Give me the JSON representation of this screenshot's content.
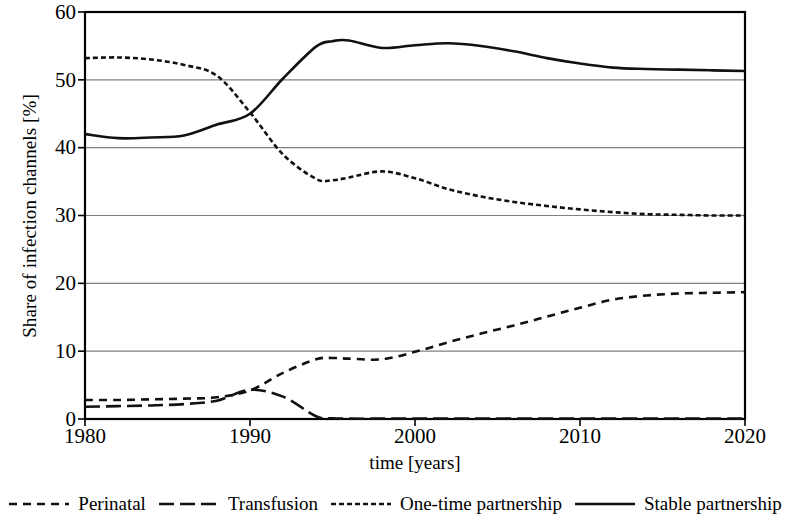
{
  "chart_data": {
    "type": "line",
    "title": "",
    "xlabel": "time [years]",
    "ylabel": "Share of infection channels [%]",
    "xlim": [
      1980,
      2020
    ],
    "ylim": [
      0,
      60
    ],
    "xticks": [
      1980,
      1990,
      2000,
      2010,
      2020
    ],
    "yticks": [
      0,
      10,
      20,
      30,
      40,
      50,
      60
    ],
    "grid": "horizontal",
    "legend_position": "bottom",
    "x": [
      1980,
      1982,
      1984,
      1986,
      1988,
      1990,
      1992,
      1994,
      1995,
      1996,
      1998,
      2000,
      2002,
      2004,
      2006,
      2008,
      2010,
      2012,
      2014,
      2016,
      2018,
      2020
    ],
    "series": [
      {
        "name": "Perinatal",
        "dash": "medium-dash",
        "values": [
          2.8,
          2.8,
          2.9,
          3.0,
          3.2,
          4.2,
          6.8,
          8.8,
          9.0,
          8.9,
          8.8,
          9.9,
          11.3,
          12.6,
          13.8,
          15.1,
          16.4,
          17.6,
          18.2,
          18.5,
          18.6,
          18.7
        ]
      },
      {
        "name": "Transfusion",
        "dash": "long-dash",
        "values": [
          1.8,
          1.9,
          2.0,
          2.2,
          2.7,
          4.3,
          3.3,
          0.4,
          0.1,
          0.05,
          0.05,
          0.05,
          0.05,
          0.05,
          0.05,
          0.05,
          0.05,
          0.05,
          0.05,
          0.05,
          0.05,
          0.05
        ]
      },
      {
        "name": "One-time partnership",
        "dash": "short-dash",
        "values": [
          53.2,
          53.3,
          53.0,
          52.2,
          50.6,
          45.2,
          39.0,
          35.4,
          35.2,
          35.6,
          36.5,
          35.5,
          33.9,
          32.8,
          32.0,
          31.4,
          30.9,
          30.5,
          30.2,
          30.1,
          30.0,
          30.0
        ]
      },
      {
        "name": "Stable partnership",
        "dash": "solid",
        "values": [
          42.0,
          41.4,
          41.5,
          41.8,
          43.4,
          45.0,
          50.2,
          54.9,
          55.7,
          55.8,
          54.7,
          55.1,
          55.4,
          55.0,
          54.2,
          53.2,
          52.4,
          51.8,
          51.6,
          51.5,
          51.4,
          51.3
        ]
      }
    ]
  },
  "axis": {
    "y_tick_labels": [
      "60",
      "50",
      "40",
      "30",
      "20",
      "10",
      "0"
    ],
    "x_tick_labels": [
      "1980",
      "1990",
      "2000",
      "2010",
      "2020"
    ],
    "y_title": "Share of infection channels [%]",
    "x_title": "time [years]"
  },
  "legend": {
    "items": [
      {
        "label": "Perinatal",
        "style": "medium-dash"
      },
      {
        "label": "Transfusion",
        "style": "long-dash"
      },
      {
        "label": "One-time partnership",
        "style": "short-dash"
      },
      {
        "label": "Stable partnership",
        "style": "solid"
      }
    ]
  },
  "colors": {
    "line": "#111111",
    "grid": "#808080",
    "axis": "#000000",
    "background": "#ffffff"
  }
}
